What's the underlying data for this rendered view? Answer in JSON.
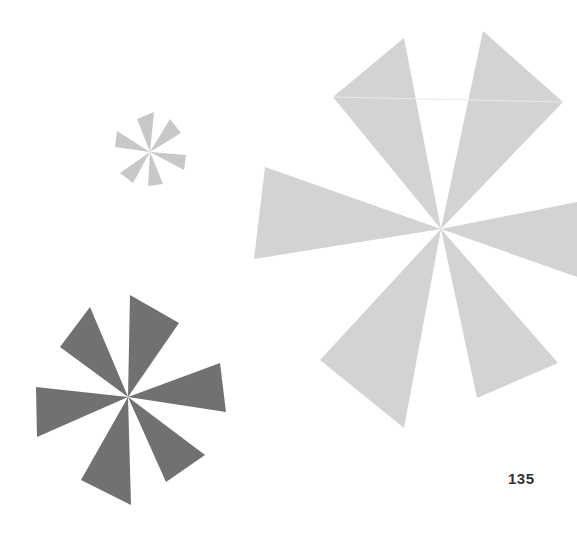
{
  "page": {
    "page_number": "135",
    "background": "#ffffff"
  },
  "shapes": [
    {
      "name": "small-asterisk",
      "color": "#c8c8c8"
    },
    {
      "name": "large-asterisk",
      "color": "#d2d2d2"
    },
    {
      "name": "dark-asterisk",
      "color": "#717171"
    }
  ]
}
